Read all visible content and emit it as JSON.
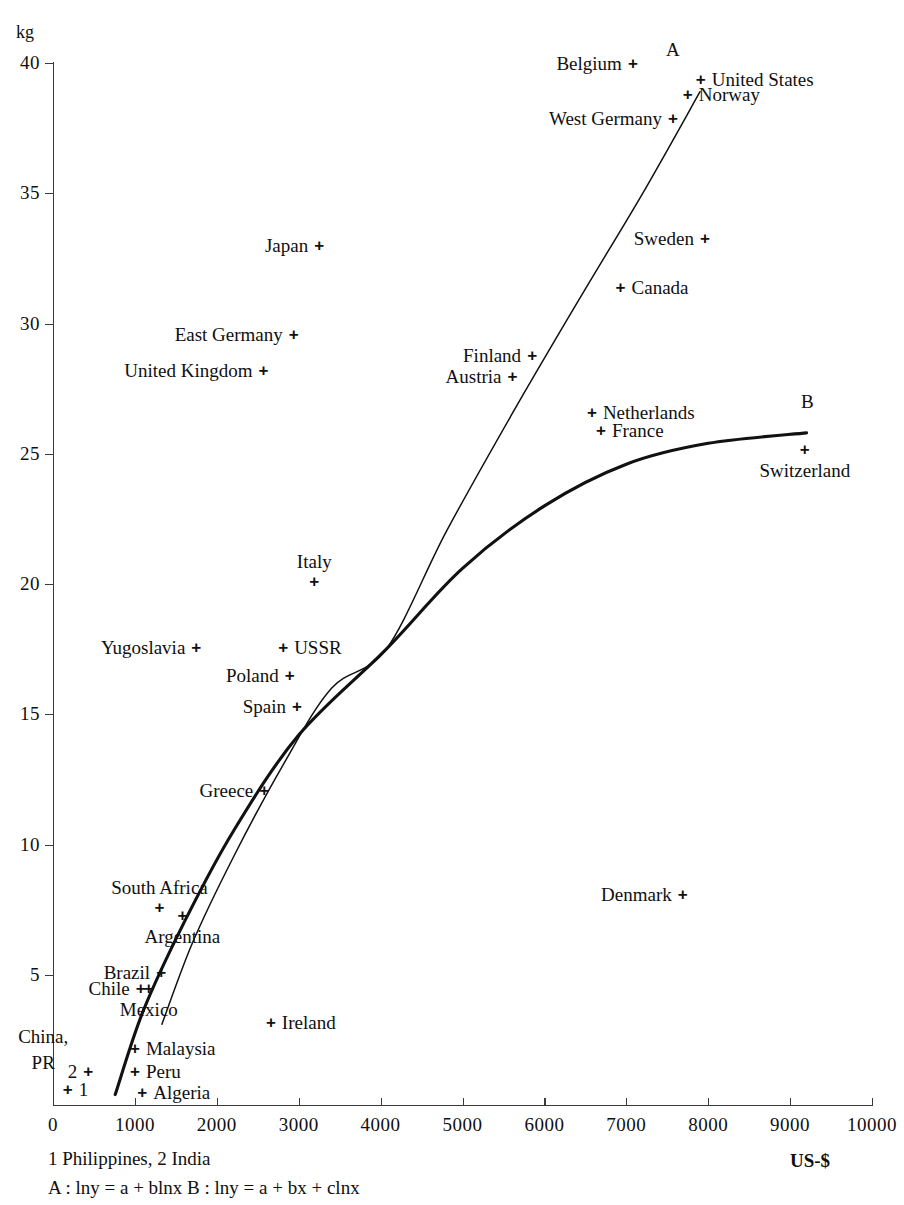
{
  "chart_data": {
    "type": "scatter",
    "title": "",
    "xlabel": "US-$",
    "ylabel": "kg",
    "xlim": [
      0,
      10000
    ],
    "ylim": [
      0,
      40
    ],
    "grid": false,
    "legend_position": "none",
    "x_ticks": [
      "0",
      "1000",
      "2000",
      "3000",
      "4000",
      "5000",
      "6000",
      "7000",
      "8000",
      "9000",
      "10000"
    ],
    "y_ticks": [
      "5",
      "10",
      "15",
      "20",
      "25",
      "30",
      "35",
      "40"
    ],
    "points": [
      {
        "label": "Belgium",
        "x": 7080,
        "y": 40.0,
        "label_side": "left"
      },
      {
        "label": "United States",
        "x": 7910,
        "y": 39.4,
        "label_side": "right"
      },
      {
        "label": "Norway",
        "x": 7750,
        "y": 38.8,
        "label_side": "right"
      },
      {
        "label": "West  Germany",
        "x": 7570,
        "y": 37.9,
        "label_side": "left"
      },
      {
        "label": "Sweden",
        "x": 7960,
        "y": 33.3,
        "label_side": "left"
      },
      {
        "label": "Japan",
        "x": 3250,
        "y": 33.0,
        "label_side": "left"
      },
      {
        "label": "Canada",
        "x": 6930,
        "y": 31.4,
        "label_side": "right"
      },
      {
        "label": "East Germany",
        "x": 2940,
        "y": 29.6,
        "label_side": "left"
      },
      {
        "label": "Finland",
        "x": 5850,
        "y": 28.8,
        "label_side": "left"
      },
      {
        "label": "United Kingdom",
        "x": 2570,
        "y": 28.2,
        "label_side": "left"
      },
      {
        "label": "Austria",
        "x": 5610,
        "y": 28.0,
        "label_side": "left"
      },
      {
        "label": "Netherlands",
        "x": 6580,
        "y": 26.6,
        "label_side": "right"
      },
      {
        "label": "France",
        "x": 6690,
        "y": 25.9,
        "label_side": "right"
      },
      {
        "label": "Switzerland",
        "x": 9180,
        "y": 25.2,
        "label_side": "below"
      },
      {
        "label": "Italy",
        "x": 3190,
        "y": 20.1,
        "label_side": "above"
      },
      {
        "label": "USSR",
        "x": 2810,
        "y": 17.6,
        "label_side": "right"
      },
      {
        "label": "Yugoslavia",
        "x": 1750,
        "y": 17.6,
        "label_side": "left"
      },
      {
        "label": "Poland",
        "x": 2890,
        "y": 16.5,
        "label_side": "left"
      },
      {
        "label": "Spain",
        "x": 2980,
        "y": 15.3,
        "label_side": "left"
      },
      {
        "label": "Greece",
        "x": 2580,
        "y": 12.1,
        "label_side": "left"
      },
      {
        "label": "Denmark",
        "x": 7690,
        "y": 8.1,
        "label_side": "left"
      },
      {
        "label": "South Africa",
        "x": 1300,
        "y": 7.6,
        "label_side": "above"
      },
      {
        "label": "Argentina",
        "x": 1580,
        "y": 7.3,
        "label_side": "below"
      },
      {
        "label": "Brazil",
        "x": 1320,
        "y": 5.1,
        "label_side": "left"
      },
      {
        "label": "Chile",
        "x": 1070,
        "y": 4.5,
        "label_side": "left"
      },
      {
        "label": "Mexico",
        "x": 1170,
        "y": 4.5,
        "label_side": "below"
      },
      {
        "label": "Ireland",
        "x": 2660,
        "y": 3.2,
        "label_side": "right"
      },
      {
        "label": "Malaysia",
        "x": 1000,
        "y": 2.2,
        "label_side": "right"
      },
      {
        "label": "Peru",
        "x": 1000,
        "y": 1.3,
        "label_side": "right"
      },
      {
        "label": "Algeria",
        "x": 1090,
        "y": 0.5,
        "label_side": "right"
      },
      {
        "label": "2",
        "x": 430,
        "y": 1.3,
        "label_side": "left"
      },
      {
        "label": "1",
        "x": 180,
        "y": 0.6,
        "label_side": "right"
      },
      {
        "label": "China, PR",
        "x": 260,
        "y": 0.35,
        "label_side": "none"
      }
    ],
    "curves": [
      {
        "name": "A",
        "equation": "lny = a + blnx",
        "style": "thin",
        "points": [
          [
            1330,
            3.1
          ],
          [
            1700,
            6.2
          ],
          [
            2200,
            9.5
          ],
          [
            2800,
            13.0
          ],
          [
            3400,
            16.0
          ],
          [
            4070,
            17.5
          ],
          [
            4800,
            22.0
          ],
          [
            5600,
            26.5
          ],
          [
            6400,
            30.8
          ],
          [
            7200,
            35.0
          ],
          [
            7900,
            38.9
          ]
        ]
      },
      {
        "name": "B",
        "equation": "lny = a + bx + clnx",
        "style": "thick",
        "points": [
          [
            760,
            0.4
          ],
          [
            1100,
            3.6
          ],
          [
            1600,
            7.0
          ],
          [
            2200,
            10.5
          ],
          [
            3000,
            14.2
          ],
          [
            4070,
            17.5
          ],
          [
            5000,
            20.6
          ],
          [
            6000,
            23.0
          ],
          [
            7000,
            24.6
          ],
          [
            8000,
            25.4
          ],
          [
            9200,
            25.8
          ]
        ]
      }
    ],
    "curve_markers": [
      {
        "name": "A",
        "x": 7570,
        "y": 40.5
      },
      {
        "name": "B",
        "x": 9210,
        "y": 27.0
      }
    ],
    "notes": {
      "countries": "1 Philippines, 2 India",
      "formulas": "A : lny  = a + blnx    B : lny  = a + bx + clnx"
    },
    "axis_unit_y": "kg",
    "axis_unit_x": "US-$"
  }
}
